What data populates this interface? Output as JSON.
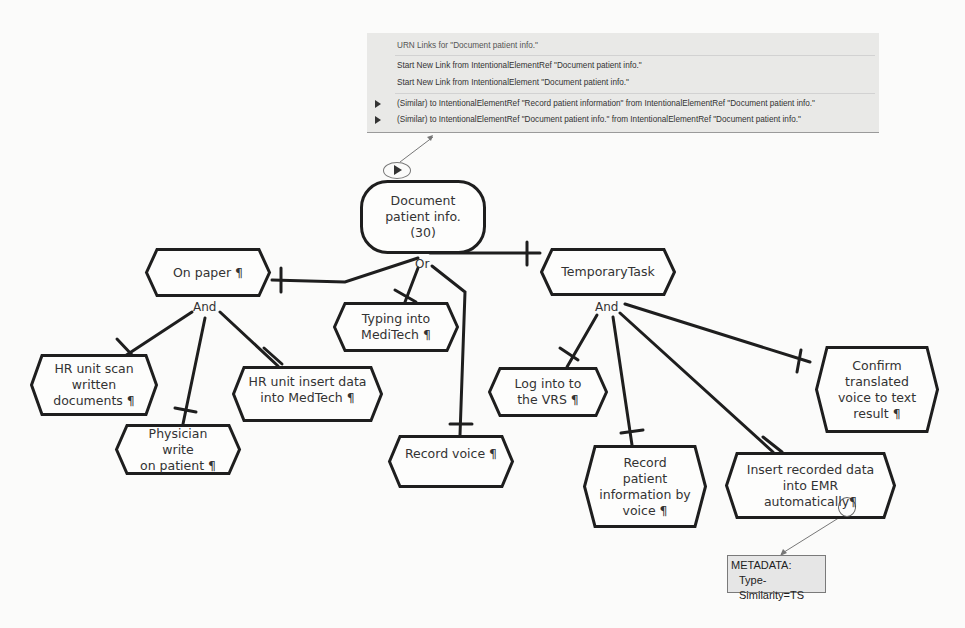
{
  "menu": {
    "title": "URN Links for \"Document patient info.\"",
    "items": [
      {
        "label": "Start New Link from IntentionalElementRef \"Document patient info.\"",
        "submenu": false
      },
      {
        "label": "Start New Link from IntentionalElement \"Document patient info.\"",
        "submenu": false
      },
      {
        "label": "(Similar) to IntentionalElementRef \"Record patient information\" from IntentionalElementRef \"Document patient info.\"",
        "submenu": true
      },
      {
        "label": "(Similar) to IntentionalElementRef \"Document patient info.\" from IntentionalElementRef \"Document patient info.\"",
        "submenu": true
      }
    ]
  },
  "goal": {
    "label": "Document\npatient info.\n(30)"
  },
  "decompositions": {
    "root": "Or",
    "on_paper": "And",
    "temporary_task": "And"
  },
  "tasks": {
    "on_paper": "On paper ¶",
    "typing_meditech": "Typing into\nMediTech ¶",
    "record_voice": "Record voice ¶",
    "temporary_task": "TemporaryTask",
    "hr_scan": "HR unit scan\nwritten\ndocuments ¶",
    "physician_write": "Physician write\non patient ¶",
    "hr_insert": "HR unit insert data\ninto MedTech ¶",
    "log_vrs": "Log into to\nthe VRS ¶",
    "record_patient_voice": "Record\npatient\ninformation by\nvoice ¶",
    "insert_emr": "Insert recorded data\ninto EMR\nautomatically¶",
    "confirm_translated": "Confirm\ntranslated\nvoice to text\nresult ¶"
  },
  "metadata": {
    "heading": "METADATA:",
    "value": "Type-Similarity=TS"
  },
  "colors": {
    "stroke": "#1e1e1e",
    "menu_bg": "#e9e9e7",
    "meta_bg": "#e6e6e6"
  }
}
